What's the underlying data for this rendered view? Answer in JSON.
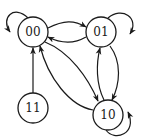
{
  "diagram": {
    "type": "state-transition-graph",
    "nodes": [
      {
        "id": "00",
        "label": "00"
      },
      {
        "id": "01",
        "label": "01"
      },
      {
        "id": "10",
        "label": "10"
      },
      {
        "id": "11",
        "label": "11"
      }
    ],
    "edges": [
      {
        "from": "00",
        "to": "00"
      },
      {
        "from": "01",
        "to": "01"
      },
      {
        "from": "10",
        "to": "10"
      },
      {
        "from": "00",
        "to": "01"
      },
      {
        "from": "01",
        "to": "00"
      },
      {
        "from": "00",
        "to": "10"
      },
      {
        "from": "10",
        "to": "00"
      },
      {
        "from": "01",
        "to": "10"
      },
      {
        "from": "10",
        "to": "01"
      },
      {
        "from": "11",
        "to": "00"
      }
    ],
    "colors": {
      "stroke": "#1a1a1a",
      "background": "#ffffff"
    }
  }
}
